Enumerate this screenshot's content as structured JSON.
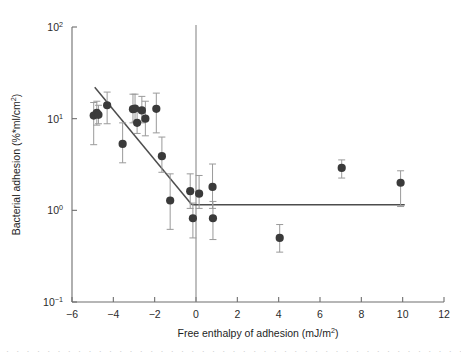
{
  "figure": {
    "background": "#ffffff",
    "marker_color": "#3a3a3a",
    "errorbar_color": "#9a9a9a",
    "line_color": "#4d4d4d",
    "axis_color": "#6e6e6e"
  },
  "chart_data": {
    "type": "scatter",
    "title": "",
    "xlabel": "Free enthalpy of adhesion (mJ/m",
    "xlabel_sup": "2",
    "xlabel_tail": ")",
    "ylabel": "Bacterial adhesion (%*ml/cm",
    "ylabel_sup": "2",
    "ylabel_tail": ")",
    "xlim": [
      -6,
      12
    ],
    "ylim": [
      0.1,
      100
    ],
    "yscale": "log",
    "grid": false,
    "legend": null,
    "xticks": [
      -6,
      -4,
      -2,
      0,
      2,
      4,
      6,
      8,
      10,
      12
    ],
    "xtick_labels": [
      "−6",
      "−4",
      "−2",
      "0",
      "2",
      "4",
      "6",
      "8",
      "10",
      "12"
    ],
    "yticks": [
      0.1,
      1,
      10,
      100
    ],
    "ytick_labels": [
      {
        "base": "10",
        "exp": "−1"
      },
      {
        "base": "10",
        "exp": "0"
      },
      {
        "base": "10",
        "exp": "1"
      },
      {
        "base": "10",
        "exp": "2"
      }
    ],
    "points": [
      {
        "x": -4.95,
        "y": 10.8,
        "yerr_low": 5.2,
        "yerr_high": 15.0
      },
      {
        "x": -4.8,
        "y": 11.6,
        "yerr_low": 8.5,
        "yerr_high": 15.5
      },
      {
        "x": -4.72,
        "y": 11.0,
        "yerr_low": 8.8,
        "yerr_high": 14.0
      },
      {
        "x": -4.3,
        "y": 14.0,
        "yerr_low": 8.8,
        "yerr_high": 19.5
      },
      {
        "x": -3.55,
        "y": 5.3,
        "yerr_low": 3.3,
        "yerr_high": 9.0
      },
      {
        "x": -3.05,
        "y": 12.7,
        "yerr_low": 9.0,
        "yerr_high": 18.5
      },
      {
        "x": -2.95,
        "y": 12.9,
        "yerr_low": 9.2,
        "yerr_high": 18.5
      },
      {
        "x": -2.85,
        "y": 9.0,
        "yerr_low": 6.9,
        "yerr_high": 12.0
      },
      {
        "x": -2.62,
        "y": 12.3,
        "yerr_low": 9.0,
        "yerr_high": 17.5
      },
      {
        "x": -2.45,
        "y": 10.0,
        "yerr_low": 6.5,
        "yerr_high": 15.5
      },
      {
        "x": -1.92,
        "y": 12.8,
        "yerr_low": 7.0,
        "yerr_high": 19.0
      },
      {
        "x": -1.65,
        "y": 3.9,
        "yerr_low": 2.6,
        "yerr_high": 6.3
      },
      {
        "x": -1.25,
        "y": 1.28,
        "yerr_low": 0.62,
        "yerr_high": 2.5
      },
      {
        "x": -0.28,
        "y": 1.62,
        "yerr_low": 1.05,
        "yerr_high": 2.5
      },
      {
        "x": -0.15,
        "y": 0.82,
        "yerr_low": 0.5,
        "yerr_high": 1.2
      },
      {
        "x": 0.15,
        "y": 1.52,
        "yerr_low": 1.05,
        "yerr_high": 2.4
      },
      {
        "x": 0.8,
        "y": 1.8,
        "yerr_low": 1.05,
        "yerr_high": 3.2
      },
      {
        "x": 0.82,
        "y": 0.82,
        "yerr_low": 0.48,
        "yerr_high": 1.25
      },
      {
        "x": 4.05,
        "y": 0.5,
        "yerr_low": 0.35,
        "yerr_high": 0.7
      },
      {
        "x": 7.05,
        "y": 2.9,
        "yerr_low": 2.25,
        "yerr_high": 3.55
      },
      {
        "x": 9.9,
        "y": 2.0,
        "yerr_low": 1.1,
        "yerr_high": 2.7
      }
    ],
    "fit_segments": [
      {
        "name": "declining-regression",
        "x1": -4.9,
        "y1": 22.0,
        "x2": -0.2,
        "y2": 1.15
      },
      {
        "name": "plateau-regression",
        "x1": -0.2,
        "y1": 1.15,
        "x2": 10.1,
        "y2": 1.15
      }
    ],
    "reference_lines": [
      {
        "name": "zero-enthalpy-vertical",
        "orientation": "vertical",
        "x": 0
      }
    ]
  },
  "caption": {
    "partial_text": "· · · · · · · · · · · · · · · · · · · · · · · · · · · · · · · · · · · · · · · · · · · · · · ·"
  }
}
